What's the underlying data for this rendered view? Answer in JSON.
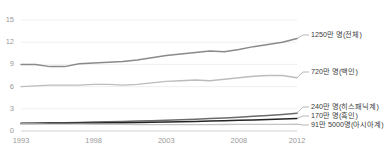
{
  "chart_data": {
    "type": "line",
    "title": "",
    "subtitle": "",
    "xlabel": "",
    "ylabel": "",
    "xlim": [
      1993,
      2012
    ],
    "ylim": [
      0,
      15
    ],
    "yticks": [
      "0",
      "3",
      "6",
      "9",
      "12",
      "15"
    ],
    "ytick_values": [
      0,
      3,
      6,
      9,
      12,
      15
    ],
    "xticks": [
      "1993",
      "1998",
      "2003",
      "2008",
      "2012"
    ],
    "xtick_values": [
      1993,
      1998,
      2003,
      2008,
      2012
    ],
    "grid": true,
    "legend_position": "right-inline",
    "x": [
      1993,
      1994,
      1995,
      1996,
      1997,
      1998,
      1999,
      2000,
      2001,
      2002,
      2003,
      2004,
      2005,
      2006,
      2007,
      2008,
      2009,
      2010,
      2011,
      2012
    ],
    "series": [
      {
        "name": "1250만 명(전체)",
        "label": "1250만 명(전체)",
        "color": "#8a8a8a",
        "end_value": 12.5,
        "values": [
          9.0,
          9.0,
          8.7,
          8.7,
          9.1,
          9.2,
          9.3,
          9.4,
          9.6,
          9.9,
          10.2,
          10.4,
          10.6,
          10.8,
          10.7,
          11.0,
          11.4,
          11.7,
          12.0,
          12.5
        ]
      },
      {
        "name": "720만 명(백인)",
        "label": "720만 명(백인)",
        "color": "#bcbcbc",
        "end_value": 7.2,
        "values": [
          6.0,
          6.1,
          6.2,
          6.2,
          6.2,
          6.3,
          6.3,
          6.2,
          6.3,
          6.5,
          6.7,
          6.8,
          6.9,
          6.8,
          7.0,
          7.2,
          7.4,
          7.5,
          7.5,
          7.2
        ]
      },
      {
        "name": "240만 명(히스패닉계)",
        "label": "240만 명(히스패닉계)",
        "color": "#6b6b6b",
        "end_value": 2.4,
        "values": [
          1.05,
          1.08,
          1.1,
          1.12,
          1.16,
          1.2,
          1.24,
          1.28,
          1.34,
          1.4,
          1.46,
          1.52,
          1.6,
          1.68,
          1.76,
          1.86,
          1.98,
          2.1,
          2.24,
          2.4
        ]
      },
      {
        "name": "170만 명(흑인)",
        "label": "170만 명(흑인)",
        "color": "#242424",
        "end_value": 1.7,
        "values": [
          1.02,
          1.03,
          1.04,
          1.05,
          1.07,
          1.09,
          1.11,
          1.13,
          1.16,
          1.19,
          1.22,
          1.26,
          1.3,
          1.34,
          1.39,
          1.44,
          1.5,
          1.56,
          1.63,
          1.7
        ]
      },
      {
        "name": "91만 5000명(아시아계)",
        "label": "91만 5000명(아시아계)",
        "color": "#c4c4c4",
        "end_value": 0.915,
        "values": [
          0.96,
          0.95,
          0.94,
          0.93,
          0.92,
          0.91,
          0.9,
          0.89,
          0.88,
          0.875,
          0.87,
          0.87,
          0.87,
          0.875,
          0.88,
          0.885,
          0.89,
          0.9,
          0.905,
          0.915
        ]
      }
    ]
  }
}
